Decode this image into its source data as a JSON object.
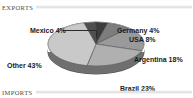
{
  "sections": {
    "exports": {
      "title": "EXPORTS"
    },
    "imports": {
      "title": "IMPORTS"
    }
  },
  "chart_data": {
    "type": "pie",
    "title": "EXPORTS",
    "xlabel": "",
    "ylabel": "",
    "unit": "%",
    "legend_position": "none",
    "labels_style": "outside-with-leader-lines",
    "three_d": true,
    "start_angle_deg": 0,
    "direction": "clockwise",
    "categories": [
      "Germany",
      "USA",
      "Argentina",
      "Brazil",
      "Other",
      "Mexico"
    ],
    "values": [
      4,
      8,
      18,
      23,
      43,
      4
    ],
    "total": 100,
    "slices": [
      {
        "name": "Germany",
        "value": 4,
        "label": "Germany 4%",
        "color": "#3c3c3c"
      },
      {
        "name": "USA",
        "value": 8,
        "label": "USA 8%",
        "color": "#7d7d7d"
      },
      {
        "name": "Argentina",
        "value": 18,
        "label": "Argentina 18%",
        "color": "#9a9a9a"
      },
      {
        "name": "Brazil",
        "value": 23,
        "label": "Brazil 23%",
        "color": "#b0b0b0"
      },
      {
        "name": "Other",
        "value": 43,
        "label": "Other 43%",
        "color": "#c9c9c9"
      },
      {
        "name": "Mexico",
        "value": 4,
        "label": "Mexico 4%",
        "color": "#4f4f4f"
      }
    ]
  }
}
